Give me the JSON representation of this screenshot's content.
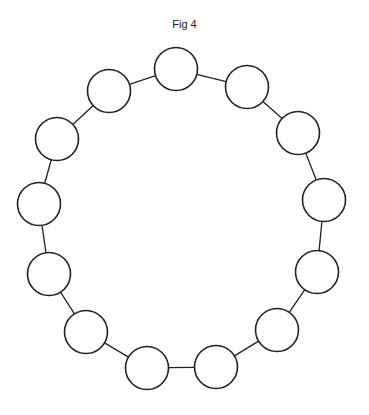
{
  "figure": {
    "title": "Fig 4",
    "node_count": 13,
    "node_radius": 21.5,
    "stroke_color": "#222222",
    "nodes": [
      {
        "x": 176,
        "y": 69
      },
      {
        "x": 247,
        "y": 87
      },
      {
        "x": 298,
        "y": 133
      },
      {
        "x": 324,
        "y": 200
      },
      {
        "x": 317,
        "y": 272
      },
      {
        "x": 277,
        "y": 330
      },
      {
        "x": 216,
        "y": 367
      },
      {
        "x": 147,
        "y": 368
      },
      {
        "x": 86,
        "y": 332
      },
      {
        "x": 49,
        "y": 274
      },
      {
        "x": 39,
        "y": 204
      },
      {
        "x": 57,
        "y": 139
      },
      {
        "x": 109,
        "y": 91
      }
    ]
  }
}
